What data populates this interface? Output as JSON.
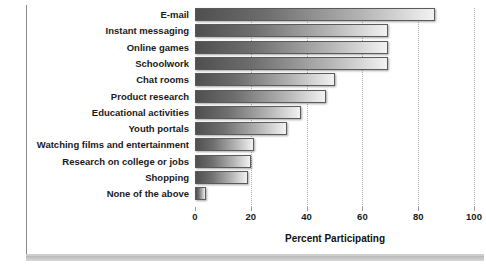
{
  "chart_data": {
    "type": "bar",
    "orientation": "horizontal",
    "title": "",
    "xlabel": "Percent Participating",
    "ylabel": "",
    "xlim": [
      0,
      100
    ],
    "xticks": [
      0,
      20,
      40,
      60,
      80,
      100
    ],
    "grid": true,
    "legend": false,
    "categories": [
      "E-mail",
      "Instant messaging",
      "Online games",
      "Schoolwork",
      "Chat rooms",
      "Product research",
      "Educational activities",
      "Youth portals",
      "Watching films and entertainment",
      "Research on college or jobs",
      "Shopping",
      "None of the above"
    ],
    "values": [
      86,
      69,
      69,
      69,
      50,
      47,
      38,
      33,
      21,
      20,
      19,
      4
    ]
  },
  "style": {
    "bar_fill_dark": "#4f4f4f",
    "bar_fill_light": "#f2f2f2",
    "bar_border": "#5a5a5a",
    "gridline_color": "#b0b0b0",
    "text_color": "#1a1a1a",
    "background": "#ffffff"
  }
}
